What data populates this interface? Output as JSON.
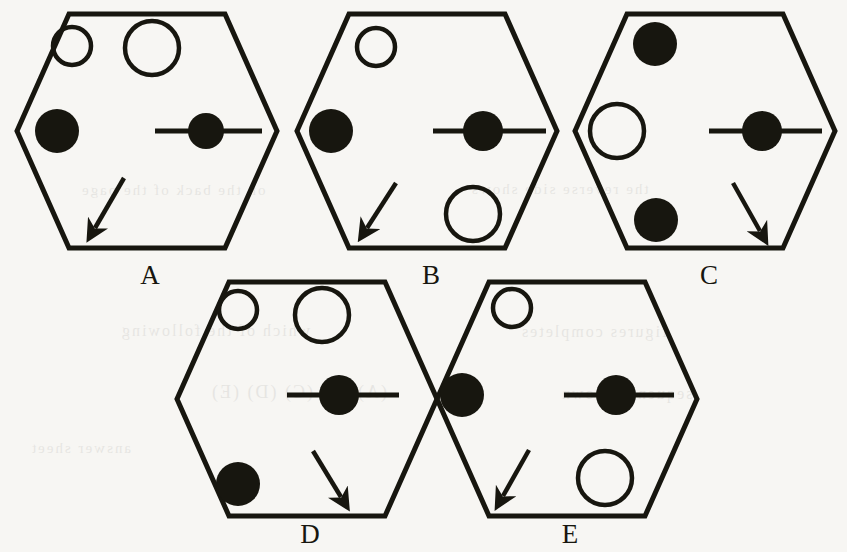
{
  "page": {
    "kind": "multiple-choice figure set",
    "background_color": "#f7f6f3",
    "ink_color": "#17160f",
    "width": 847,
    "height": 552
  },
  "figures": [
    {
      "id": "A",
      "label": "A",
      "label_x": 130,
      "label_y": 262,
      "hexagon": {
        "cx": 147,
        "cy": 131,
        "rx": 130,
        "ry": 117
      },
      "elements": [
        {
          "name": "small-open-circle",
          "shape": "circle",
          "fill": "none",
          "cx": 72,
          "cy": 46,
          "r": 19
        },
        {
          "name": "large-open-circle",
          "shape": "circle",
          "fill": "none",
          "cx": 152,
          "cy": 48,
          "r": 27
        },
        {
          "name": "filled-circle-left",
          "shape": "circle",
          "fill": "solid",
          "cx": 57,
          "cy": 131,
          "r": 22
        },
        {
          "name": "filled-circle-on-line",
          "shape": "circle-on-line",
          "fill": "solid",
          "cx": 206,
          "cy": 131,
          "r": 18,
          "line_x1": 155,
          "line_x2": 262
        },
        {
          "name": "arrow-down-left",
          "shape": "arrow",
          "x1": 124,
          "y1": 178,
          "x2": 95,
          "y2": 228
        }
      ]
    },
    {
      "id": "B",
      "label": "B",
      "label_x": 411,
      "label_y": 262,
      "hexagon": {
        "cx": 427,
        "cy": 131,
        "rx": 130,
        "ry": 117
      },
      "elements": [
        {
          "name": "small-open-circle",
          "shape": "circle",
          "fill": "none",
          "cx": 376,
          "cy": 47,
          "r": 19
        },
        {
          "name": "filled-circle-left",
          "shape": "circle",
          "fill": "solid",
          "cx": 331,
          "cy": 131,
          "r": 22
        },
        {
          "name": "filled-circle-on-line",
          "shape": "circle-on-line",
          "fill": "solid",
          "cx": 483,
          "cy": 131,
          "r": 20,
          "line_x1": 433,
          "line_x2": 546
        },
        {
          "name": "arrow-down-left",
          "shape": "arrow",
          "x1": 396,
          "y1": 183,
          "x2": 367,
          "y2": 228
        },
        {
          "name": "large-open-circle",
          "shape": "circle",
          "fill": "none",
          "cx": 473,
          "cy": 214,
          "r": 27
        }
      ]
    },
    {
      "id": "C",
      "label": "C",
      "label_x": 689,
      "label_y": 262,
      "hexagon": {
        "cx": 705,
        "cy": 131,
        "rx": 130,
        "ry": 117
      },
      "elements": [
        {
          "name": "filled-circle-top-left",
          "shape": "circle",
          "fill": "solid",
          "cx": 655,
          "cy": 44,
          "r": 22
        },
        {
          "name": "large-open-circle-left",
          "shape": "circle",
          "fill": "none",
          "cx": 617,
          "cy": 131,
          "r": 27
        },
        {
          "name": "filled-circle-bottom-left",
          "shape": "circle",
          "fill": "solid",
          "cx": 656,
          "cy": 220,
          "r": 22
        },
        {
          "name": "filled-circle-on-line",
          "shape": "circle-on-line",
          "fill": "solid",
          "cx": 762,
          "cy": 131,
          "r": 20,
          "line_x1": 709,
          "line_x2": 822
        },
        {
          "name": "arrow-down-right",
          "shape": "arrow",
          "x1": 733,
          "y1": 183,
          "x2": 760,
          "y2": 231
        }
      ]
    },
    {
      "id": "D",
      "label": "D",
      "label_x": 290,
      "label_y": 521,
      "hexagon": {
        "cx": 307,
        "cy": 399,
        "rx": 130,
        "ry": 117
      },
      "elements": [
        {
          "name": "small-open-circle",
          "shape": "circle",
          "fill": "none",
          "cx": 238,
          "cy": 310,
          "r": 19
        },
        {
          "name": "large-open-circle",
          "shape": "circle",
          "fill": "none",
          "cx": 322,
          "cy": 315,
          "r": 27
        },
        {
          "name": "filled-circle-on-line",
          "shape": "circle-on-line",
          "fill": "solid",
          "cx": 339,
          "cy": 395,
          "r": 20,
          "line_x1": 287,
          "line_x2": 399
        },
        {
          "name": "filled-circle-bottom-left",
          "shape": "circle",
          "fill": "solid",
          "cx": 238,
          "cy": 484,
          "r": 22
        },
        {
          "name": "arrow-down-right",
          "shape": "arrow",
          "x1": 313,
          "y1": 451,
          "x2": 341,
          "y2": 497
        }
      ]
    },
    {
      "id": "E",
      "label": "E",
      "label_x": 550,
      "label_y": 521,
      "hexagon": {
        "cx": 567,
        "cy": 399,
        "rx": 130,
        "ry": 117
      },
      "elements": [
        {
          "name": "small-open-circle",
          "shape": "circle",
          "fill": "none",
          "cx": 512,
          "cy": 308,
          "r": 19
        },
        {
          "name": "filled-circle-left",
          "shape": "circle",
          "fill": "solid",
          "cx": 462,
          "cy": 395,
          "r": 22
        },
        {
          "name": "filled-circle-on-line",
          "shape": "circle-on-line",
          "fill": "solid",
          "cx": 616,
          "cy": 395,
          "r": 20,
          "line_x1": 564,
          "line_x2": 674
        },
        {
          "name": "arrow-down-left",
          "shape": "arrow",
          "x1": 529,
          "y1": 450,
          "x2": 503,
          "y2": 496
        },
        {
          "name": "large-open-circle",
          "shape": "circle",
          "fill": "none",
          "cx": 605,
          "cy": 478,
          "r": 27
        }
      ]
    }
  ],
  "ghost_text": [
    {
      "text": "on the back of the page",
      "x": 80,
      "y": 182,
      "size": 15
    },
    {
      "text": "the reverse side shows",
      "x": 470,
      "y": 181,
      "size": 15
    },
    {
      "text": "which of the following",
      "x": 120,
      "y": 322,
      "size": 16
    },
    {
      "text": "(A) (B) (C) (D) (E)",
      "x": 210,
      "y": 382,
      "size": 18
    },
    {
      "text": "figures completes",
      "x": 520,
      "y": 323,
      "size": 16
    },
    {
      "text": "sequence shown",
      "x": 560,
      "y": 385,
      "size": 16
    },
    {
      "text": "answer sheet",
      "x": 30,
      "y": 440,
      "size": 15
    }
  ]
}
